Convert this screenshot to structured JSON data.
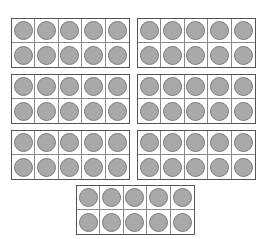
{
  "diagram": {
    "type": "ten-frames",
    "total_counters": 70,
    "colors": {
      "counter_fill": "#a9a9a9",
      "counter_stroke": "#7a7a7a",
      "frame_border": "#555555"
    },
    "frames": [
      {
        "id": 1,
        "filled": 10,
        "left": 11,
        "top": 18
      },
      {
        "id": 2,
        "filled": 10,
        "left": 137,
        "top": 18
      },
      {
        "id": 3,
        "filled": 10,
        "left": 11,
        "top": 74
      },
      {
        "id": 4,
        "filled": 10,
        "left": 137,
        "top": 74
      },
      {
        "id": 5,
        "filled": 10,
        "left": 11,
        "top": 130
      },
      {
        "id": 6,
        "filled": 10,
        "left": 137,
        "top": 130
      },
      {
        "id": 7,
        "filled": 10,
        "left": 76,
        "top": 185
      }
    ]
  }
}
